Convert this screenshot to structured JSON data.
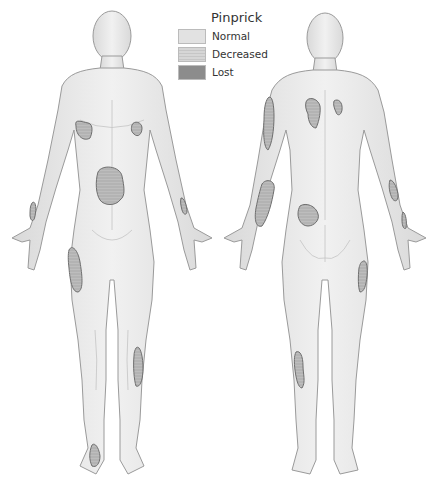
{
  "legend": {
    "title": "Pinprick",
    "items": [
      {
        "label": "Normal",
        "color": "#e2e2e2"
      },
      {
        "label": "Decreased",
        "color": "#d2d2d2"
      },
      {
        "label": "Lost",
        "color": "#8c8c8c"
      }
    ]
  },
  "figures": {
    "front": {
      "view": "anterior"
    },
    "back": {
      "view": "posterior"
    }
  },
  "colors": {
    "skin": "#e9e9e9",
    "outline": "#9a9a9a",
    "patch_fill": "#b9b9b9",
    "patch_stroke": "#6e6e6e"
  }
}
